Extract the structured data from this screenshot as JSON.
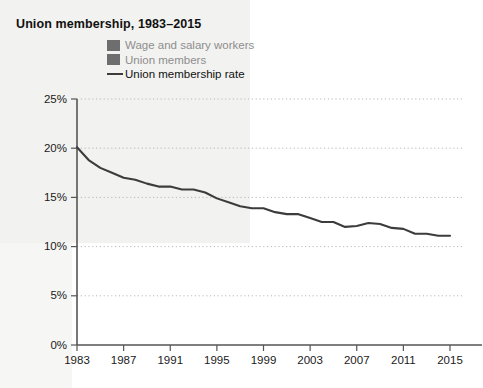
{
  "chart_data": {
    "type": "line",
    "title": "Union membership, 1983–2015",
    "xlabel": "",
    "ylabel": "",
    "ylim": [
      0,
      25
    ],
    "xlim": [
      1983,
      2015
    ],
    "grid": true,
    "grid_style": "dotted-horizontal",
    "legend_position": "top-center",
    "y_tick_labels": [
      "0%",
      "5%",
      "10%",
      "15%",
      "20%",
      "25%"
    ],
    "y_tick_values": [
      0,
      5,
      10,
      15,
      20,
      25
    ],
    "x_tick_labels": [
      "1983",
      "1987",
      "1991",
      "1995",
      "1999",
      "2003",
      "2007",
      "2011",
      "2015"
    ],
    "x_tick_values": [
      1983,
      1987,
      1991,
      1995,
      1999,
      2003,
      2007,
      2011,
      2015
    ],
    "legend": [
      {
        "label": "Wage and salary workers",
        "marker": "square",
        "color": "#6e6e6e"
      },
      {
        "label": "Union members",
        "marker": "square",
        "color": "#6e6e6e"
      },
      {
        "label": "Union membership rate",
        "marker": "line",
        "color": "#3c3c3c"
      }
    ],
    "series": [
      {
        "name": "Union membership rate",
        "unit": "percent",
        "color": "#3c3c3c",
        "x": [
          1983,
          1984,
          1985,
          1986,
          1987,
          1988,
          1989,
          1990,
          1991,
          1992,
          1993,
          1994,
          1995,
          1996,
          1997,
          1998,
          1999,
          2000,
          2001,
          2002,
          2003,
          2004,
          2005,
          2006,
          2007,
          2008,
          2009,
          2010,
          2011,
          2012,
          2013,
          2014,
          2015
        ],
        "values": [
          20.1,
          18.8,
          18.0,
          17.5,
          17.0,
          16.8,
          16.4,
          16.1,
          16.1,
          15.8,
          15.8,
          15.5,
          14.9,
          14.5,
          14.1,
          13.9,
          13.9,
          13.5,
          13.3,
          13.3,
          12.9,
          12.5,
          12.5,
          12.0,
          12.1,
          12.4,
          12.3,
          11.9,
          11.8,
          11.3,
          11.3,
          11.1,
          11.1
        ]
      }
    ]
  },
  "plot_geometry": {
    "left": 77,
    "right": 450,
    "top": 99,
    "bottom": 345,
    "grid_overhang": 12
  }
}
